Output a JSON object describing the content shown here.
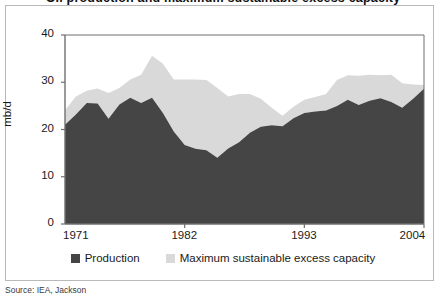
{
  "figure": {
    "title": "Oil production and maximum sustainable excess capacity",
    "source_note": "Source: IEA, Jackson"
  },
  "legend": {
    "position": "bottom-center",
    "items": [
      {
        "label": "Production",
        "color": "#454545",
        "swatch": "square-swatch"
      },
      {
        "label": "Maximum sustainable excess capacity",
        "color": "#d9d9d9",
        "swatch": "square-swatch"
      }
    ]
  },
  "axes": {
    "ylabel": "mb/d",
    "yticks": [
      "0",
      "10",
      "20",
      "30",
      "40"
    ],
    "xticks": [
      "1971",
      "1982",
      "1993",
      "2004"
    ]
  },
  "chart_data": {
    "type": "area",
    "stacked": true,
    "title": "Oil production and maximum sustainable excess capacity",
    "xlabel": "",
    "ylabel": "mb/d",
    "xlim": [
      1971,
      2004
    ],
    "ylim": [
      0,
      40
    ],
    "grid": false,
    "legend_position": "bottom-center",
    "x": [
      1971,
      1972,
      1973,
      1974,
      1975,
      1976,
      1977,
      1978,
      1979,
      1980,
      1981,
      1982,
      1983,
      1984,
      1985,
      1986,
      1987,
      1988,
      1989,
      1990,
      1991,
      1992,
      1993,
      1994,
      1995,
      1996,
      1997,
      1998,
      1999,
      2000,
      2001,
      2002,
      2003,
      2004
    ],
    "series": [
      {
        "name": "Production",
        "color": "#454545",
        "values": [
          21.0,
          23.2,
          25.6,
          25.5,
          22.3,
          25.3,
          26.7,
          25.6,
          26.7,
          23.5,
          19.6,
          16.7,
          15.9,
          15.6,
          14.0,
          16.0,
          17.3,
          19.3,
          20.6,
          20.9,
          20.7,
          22.4,
          23.5,
          23.8,
          24.0,
          25.0,
          26.3,
          25.2,
          26.1,
          26.6,
          25.8,
          24.6,
          26.5,
          28.6
        ]
      },
      {
        "name": "Maximum sustainable excess capacity",
        "color": "#d9d9d9",
        "values": [
          3.1,
          3.8,
          2.6,
          3.2,
          5.4,
          3.5,
          3.9,
          6.0,
          8.9,
          10.4,
          11.0,
          13.9,
          14.7,
          14.9,
          14.8,
          11.0,
          10.2,
          8.2,
          5.9,
          3.7,
          2.2,
          2.4,
          2.8,
          3.1,
          3.5,
          5.5,
          5.2,
          6.2,
          5.5,
          4.9,
          5.8,
          5.2,
          3.0,
          0.8
        ]
      }
    ],
    "totals": [
      24.1,
      27.0,
      28.2,
      28.7,
      27.7,
      28.8,
      30.6,
      31.6,
      35.6,
      33.9,
      30.6,
      30.6,
      30.6,
      30.5,
      28.8,
      27.0,
      27.5,
      27.5,
      26.5,
      24.6,
      22.9,
      24.8,
      26.3,
      26.9,
      27.5,
      30.5,
      31.5,
      31.4,
      31.6,
      31.5,
      31.6,
      29.8,
      29.5,
      29.4
    ]
  }
}
